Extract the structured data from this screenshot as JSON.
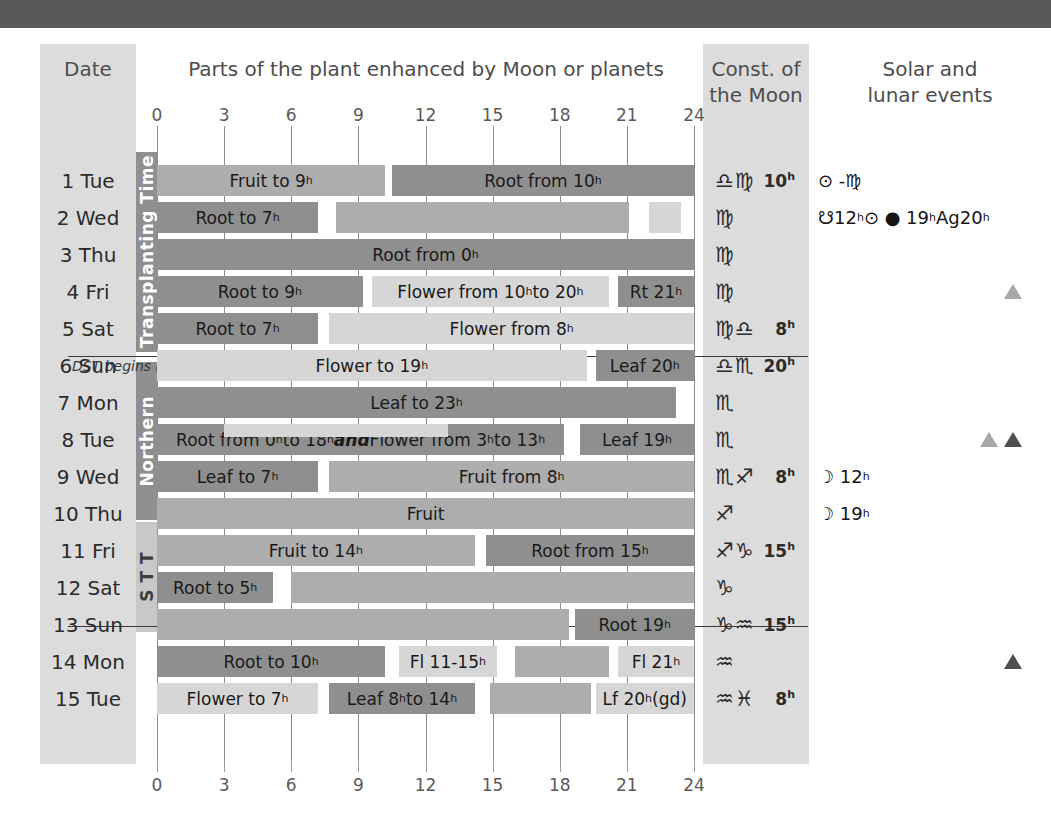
{
  "headers": {
    "date": "Date",
    "parts": "Parts of the plant enhanced by Moon or planets",
    "const": "Const. of\nthe Moon",
    "const_line1": "Const. of",
    "const_line2": "the Moon",
    "solar_line1": "Solar and",
    "solar_line2": "lunar events"
  },
  "axis": {
    "ticks": [
      "0",
      "3",
      "6",
      "9",
      "12",
      "15",
      "18",
      "21",
      "24"
    ],
    "min": 0,
    "max": 24
  },
  "bands": {
    "transplanting_time": "Transplanting Time",
    "northern": "Northern",
    "stt": "S T T"
  },
  "notes": {
    "dst": "DST begins in Australia"
  },
  "colors": {
    "light": "#d6d6d6",
    "medium": "#adadad",
    "dark": "#8f8f8f",
    "top_band": "#595959",
    "column_tint": "#dcdcdc",
    "triangle_light": "#a8a8a8",
    "triangle_dark": "#4f4f4f"
  },
  "chart_data": {
    "type": "bar",
    "title": "Parts of the plant enhanced by Moon or planets",
    "xlabel": "Hour of day",
    "xlim": [
      0,
      24
    ],
    "grid": true,
    "categories": [
      "1 Tue",
      "2 Wed",
      "3 Thu",
      "4 Fri",
      "5 Sat",
      "6 Sun",
      "7 Mon",
      "8 Tue",
      "9 Wed",
      "10 Thu",
      "11 Fri",
      "12 Sat",
      "13 Sun",
      "14 Mon",
      "15 Tue"
    ],
    "rows": [
      {
        "date": "1 Tue",
        "bars": [
          {
            "start": 0,
            "end": 10.2,
            "tone": "medium",
            "label": "Fruit to 9ʰ"
          },
          {
            "start": 10.5,
            "end": 24,
            "tone": "dark",
            "label": "Root from 10ʰ"
          }
        ]
      },
      {
        "date": "2 Wed",
        "bars": [
          {
            "start": 0,
            "end": 7.2,
            "tone": "dark",
            "label": "Root to 7ʰ"
          },
          {
            "start": 8.0,
            "end": 21.1,
            "tone": "medium",
            "label": ""
          },
          {
            "start": 22.0,
            "end": 23.4,
            "tone": "light",
            "label": ""
          }
        ]
      },
      {
        "date": "3 Thu",
        "bars": [
          {
            "start": 0,
            "end": 24,
            "tone": "dark",
            "label": "Root from 0ʰ"
          }
        ]
      },
      {
        "date": "4 Fri",
        "bars": [
          {
            "start": 0,
            "end": 9.2,
            "tone": "dark",
            "label": "Root to 9ʰ"
          },
          {
            "start": 9.6,
            "end": 20.2,
            "tone": "light",
            "label": "Flower from 10ʰ to 20ʰ"
          },
          {
            "start": 20.6,
            "end": 24,
            "tone": "dark",
            "label": "Rt 21ʰ"
          }
        ]
      },
      {
        "date": "5 Sat",
        "bars": [
          {
            "start": 0,
            "end": 7.2,
            "tone": "dark",
            "label": "Root to 7ʰ"
          },
          {
            "start": 7.7,
            "end": 24,
            "tone": "light",
            "label": "Flower from 8ʰ"
          }
        ]
      },
      {
        "date": "6 Sun",
        "bars": [
          {
            "start": 0,
            "end": 19.2,
            "tone": "light",
            "label": "Flower to 19ʰ"
          },
          {
            "start": 19.6,
            "end": 24,
            "tone": "dark",
            "label": "Leaf 20ʰ"
          }
        ]
      },
      {
        "date": "7 Mon",
        "bars": [
          {
            "start": 0,
            "end": 23.2,
            "tone": "dark",
            "label": "Leaf to 23ʰ"
          }
        ]
      },
      {
        "date": "8 Tue",
        "bars": [
          {
            "start": 0,
            "end": 18.2,
            "tone": "dark",
            "label": "Root from 0ʰ to 18ʰ and Flower from 3ʰ to 13ʰ"
          },
          {
            "start": 18.9,
            "end": 24,
            "tone": "dark",
            "label": "Leaf 19ʰ"
          }
        ],
        "overlay": {
          "start": 3,
          "end": 13,
          "tone": "light"
        }
      },
      {
        "date": "9 Wed",
        "bars": [
          {
            "start": 0,
            "end": 7.2,
            "tone": "dark",
            "label": "Leaf to 7ʰ"
          },
          {
            "start": 7.7,
            "end": 24,
            "tone": "medium",
            "label": "Fruit from 8ʰ"
          }
        ]
      },
      {
        "date": "10 Thu",
        "bars": [
          {
            "start": 0,
            "end": 24,
            "tone": "medium",
            "label": "Fruit"
          }
        ]
      },
      {
        "date": "11 Fri",
        "bars": [
          {
            "start": 0,
            "end": 14.2,
            "tone": "medium",
            "label": "Fruit to 14ʰ"
          },
          {
            "start": 14.7,
            "end": 24,
            "tone": "dark",
            "label": "Root from 15ʰ"
          }
        ]
      },
      {
        "date": "12 Sat",
        "bars": [
          {
            "start": 0,
            "end": 5.2,
            "tone": "dark",
            "label": "Root to 5ʰ"
          },
          {
            "start": 6.0,
            "end": 24,
            "tone": "medium",
            "label": ""
          }
        ]
      },
      {
        "date": "13 Sun",
        "bars": [
          {
            "start": 0,
            "end": 18.4,
            "tone": "medium",
            "label": ""
          },
          {
            "start": 18.7,
            "end": 24,
            "tone": "dark",
            "label": "Root 19ʰ"
          }
        ]
      },
      {
        "date": "14 Mon",
        "bars": [
          {
            "start": 0,
            "end": 10.2,
            "tone": "dark",
            "label": "Root to 10ʰ"
          },
          {
            "start": 10.8,
            "end": 15.2,
            "tone": "light",
            "label": "Fl 11-15ʰ"
          },
          {
            "start": 16.0,
            "end": 20.2,
            "tone": "medium",
            "label": ""
          },
          {
            "start": 20.6,
            "end": 24,
            "tone": "light",
            "label": "Fl 21ʰ"
          }
        ]
      },
      {
        "date": "15 Tue",
        "bars": [
          {
            "start": 0,
            "end": 7.2,
            "tone": "light",
            "label": "Flower to 7ʰ"
          },
          {
            "start": 7.7,
            "end": 14.2,
            "tone": "dark",
            "label": "Leaf 8ʰ to 14ʰ"
          },
          {
            "start": 14.9,
            "end": 19.4,
            "tone": "medium",
            "label": ""
          },
          {
            "start": 19.6,
            "end": 24,
            "tone": "light",
            "label": "Lf 20ʰ (gd)"
          }
        ]
      }
    ]
  },
  "dates": [
    {
      "label": "1 Tue",
      "const_sym": "♎♍",
      "const_hour": "10",
      "events": "sun-virgo",
      "event_text": "⊙ -♍",
      "tri": ""
    },
    {
      "label": "2 Wed",
      "const_sym": "♍",
      "const_hour": "",
      "events": "node-eclipse",
      "event_text": "☋12ʰ ⊙ ● 19ʰ Ag20ʰ",
      "tri": ""
    },
    {
      "label": "3 Thu",
      "const_sym": "♍",
      "const_hour": "",
      "events": "",
      "event_text": "",
      "tri": ""
    },
    {
      "label": "4 Fri",
      "const_sym": "♍",
      "const_hour": "",
      "events": "",
      "event_text": "",
      "tri": "light"
    },
    {
      "label": "5 Sat",
      "const_sym": "♍♎",
      "const_hour": "8",
      "events": "",
      "event_text": "",
      "tri": ""
    },
    {
      "label": "6 Sun",
      "const_sym": "♎♏",
      "const_hour": "20",
      "events": "",
      "event_text": "",
      "tri": ""
    },
    {
      "label": "7 Mon",
      "const_sym": "♏",
      "const_hour": "",
      "events": "",
      "event_text": "",
      "tri": ""
    },
    {
      "label": "8 Tue",
      "const_sym": "♏",
      "const_hour": "",
      "events": "",
      "event_text": "",
      "tri": "pair"
    },
    {
      "label": "9 Wed",
      "const_sym": "♏♐",
      "const_hour": "8",
      "events": "perigee",
      "event_text": "☽ 12ʰ",
      "tri": ""
    },
    {
      "label": "10 Thu",
      "const_sym": "♐",
      "const_hour": "",
      "events": "moon",
      "event_text": "☽ 19ʰ",
      "tri": ""
    },
    {
      "label": "11 Fri",
      "const_sym": "♐♑",
      "const_hour": "15",
      "events": "",
      "event_text": "",
      "tri": ""
    },
    {
      "label": "12 Sat",
      "const_sym": "♑",
      "const_hour": "",
      "events": "",
      "event_text": "",
      "tri": ""
    },
    {
      "label": "13 Sun",
      "const_sym": "♑♒",
      "const_hour": "15",
      "events": "",
      "event_text": "",
      "tri": ""
    },
    {
      "label": "14 Mon",
      "const_sym": "♒",
      "const_hour": "",
      "events": "",
      "event_text": "",
      "tri": "dark"
    },
    {
      "label": "15 Tue",
      "const_sym": "♒♓",
      "const_hour": "8",
      "events": "",
      "event_text": "",
      "tri": ""
    }
  ],
  "events": {
    "row1": "⊙ -♍",
    "row2_node": "☋",
    "row2_node_hour": "12",
    "row2_sun": "⊙",
    "row2_eclipse_hour": "19",
    "row2_ag": "Ag",
    "row2_ag_hour": "20",
    "row9": "12",
    "row10": "19"
  }
}
